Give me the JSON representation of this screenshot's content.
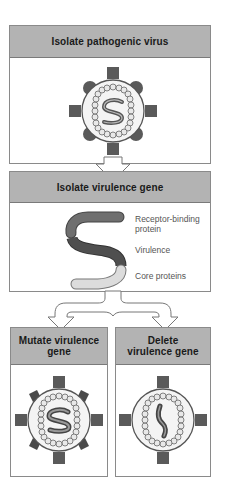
{
  "steps": {
    "step1": {
      "title": "Isolate pathogenic virus"
    },
    "step2": {
      "title": "Isolate virulence gene",
      "gene_segments": [
        {
          "label": "Receptor-binding protein",
          "color": "#6f6f6f"
        },
        {
          "label": "Virulence",
          "color": "#4f4f4f"
        },
        {
          "label": "Core proteins",
          "color": "#dcdcdc"
        }
      ]
    },
    "step3a": {
      "title": "Mutate virulence gene"
    },
    "step3b": {
      "title": "Delete virulence gene"
    }
  },
  "labels": {
    "receptor_line1": "Receptor-binding",
    "receptor_line2": "protein",
    "virulence": "Virulence",
    "core": "Core proteins"
  },
  "colors": {
    "header_fill": "#b3b3b3",
    "spike_dark": "#5a5a5a",
    "capsid_fill": "#f2f2f2",
    "bead_fill": "#e6e6e6"
  }
}
